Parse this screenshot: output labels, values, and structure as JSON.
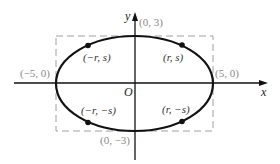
{
  "diagram": {
    "type": "ellipse-on-axes",
    "colors": {
      "curve": "#111111",
      "axes": "#111111",
      "dashed_box": "#a0a0a0",
      "intercept_labels": "#8a8a8a",
      "point_labels": "#333333"
    },
    "axes": {
      "x_label": "x",
      "y_label": "y",
      "origin_label": "O"
    },
    "intercepts": {
      "top": "(0, 3)",
      "bottom": "(0, −3)",
      "left": "(−5, 0)",
      "right": "(5, 0)"
    },
    "points": [
      {
        "label": "(−r, s)"
      },
      {
        "label": "(r, s)"
      },
      {
        "label": "(−r, −s)"
      },
      {
        "label": "(r, −s)"
      }
    ]
  }
}
